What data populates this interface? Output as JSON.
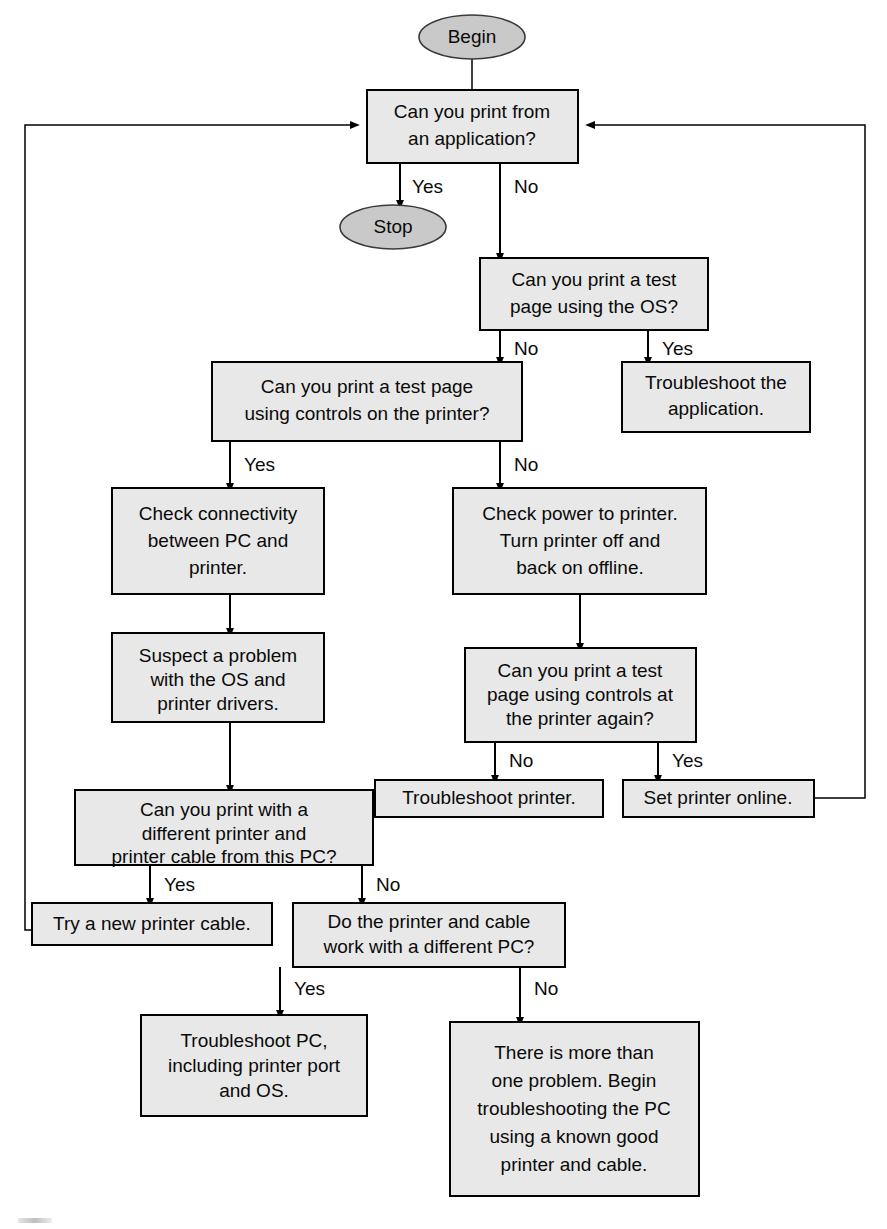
{
  "diagram": {
    "colors": {
      "box_fill": "#e8e8e8",
      "box_stroke": "#000000",
      "terminal_fill": "#c9c9c9",
      "terminal_stroke": "#3a3a3a",
      "edge": "#000000",
      "text": "#0a0a0a",
      "background": "#ffffff"
    },
    "nodes": {
      "begin": {
        "label": "Begin",
        "shape": "ellipse"
      },
      "stop": {
        "label": "Stop",
        "shape": "ellipse"
      },
      "print_from_app": {
        "line1": "Can you print from",
        "line2": "an application?",
        "shape": "box"
      },
      "test_page_os": {
        "line1": "Can you print a test",
        "line2": "page using the OS?",
        "shape": "box"
      },
      "troubleshoot_app": {
        "line1": "Troubleshoot the",
        "line2": "application.",
        "shape": "box"
      },
      "test_page_printer_controls": {
        "line1": "Can you print a test page",
        "line2": "using controls on the printer?",
        "shape": "box"
      },
      "check_connectivity": {
        "line1": "Check connectivity",
        "line2": "between PC and",
        "line3": "printer.",
        "shape": "box"
      },
      "check_power": {
        "line1": "Check power to printer.",
        "line2": "Turn printer off and",
        "line3": "back on offline.",
        "shape": "box"
      },
      "suspect_os_drivers": {
        "line1": "Suspect a problem",
        "line2": "with the OS and",
        "line3": "printer drivers.",
        "shape": "box"
      },
      "test_page_again": {
        "line1": "Can you print a test",
        "line2": "page using controls at",
        "line3": "the printer again?",
        "shape": "box"
      },
      "troubleshoot_printer": {
        "line1": "Troubleshoot printer.",
        "shape": "box"
      },
      "set_printer_online": {
        "line1": "Set printer online.",
        "shape": "box"
      },
      "different_printer_cable": {
        "line1": "Can you print with a",
        "line2": "different printer and",
        "line3": "printer cable from this PC?",
        "shape": "box"
      },
      "try_new_cable": {
        "line1": "Try a new printer cable.",
        "shape": "box"
      },
      "work_different_pc": {
        "line1": "Do the printer and cable",
        "line2": "work with a different PC?",
        "shape": "box"
      },
      "troubleshoot_pc": {
        "line1": "Troubleshoot PC,",
        "line2": "including printer port",
        "line3": "and OS.",
        "shape": "box"
      },
      "more_than_one_problem": {
        "line1": "There is more than",
        "line2": "one problem. Begin",
        "line3": "troubleshooting the PC",
        "line4": "using a known good",
        "line5": "printer and cable.",
        "shape": "box"
      }
    },
    "edge_labels": {
      "app_yes": "Yes",
      "app_no": "No",
      "os_no": "No",
      "os_yes": "Yes",
      "printer_controls_yes": "Yes",
      "printer_controls_no": "No",
      "again_no": "No",
      "again_yes": "Yes",
      "different_yes": "Yes",
      "different_no": "No",
      "diffpc_yes": "Yes",
      "diffpc_no": "No"
    }
  }
}
